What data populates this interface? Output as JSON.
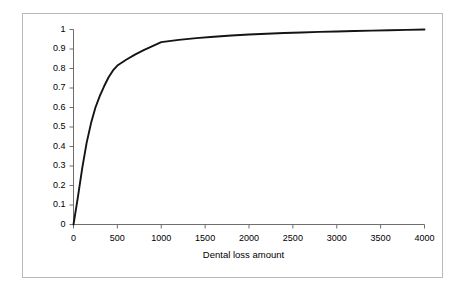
{
  "chart_data": {
    "type": "line",
    "title": "",
    "subtitle": "",
    "xlabel": "Dental loss amount",
    "ylabel": "",
    "xlim": [
      0,
      4000
    ],
    "ylim": [
      0,
      1
    ],
    "grid": false,
    "legend": null,
    "legend_position": "none",
    "x_ticks": [
      0,
      500,
      1000,
      1500,
      2000,
      2500,
      3000,
      3500,
      4000
    ],
    "x_tick_labels": [
      "0",
      "500",
      "1000",
      "1500",
      "2000",
      "2500",
      "3000",
      "3500",
      "4000"
    ],
    "y_ticks": [
      0,
      0.1,
      0.2,
      0.3,
      0.4,
      0.5,
      0.6,
      0.7,
      0.8,
      0.9,
      1
    ],
    "y_tick_labels": [
      "0",
      "0.1",
      "0.2",
      "0.3",
      "0.4",
      "0.5",
      "0.6",
      "0.7",
      "0.8",
      "0.9",
      "1"
    ],
    "series": [
      {
        "name": "Cumulative distribution of dental loss amount",
        "color": "#141414",
        "x": [
          0,
          50,
          100,
          150,
          200,
          250,
          300,
          350,
          400,
          450,
          500,
          600,
          700,
          800,
          900,
          1000,
          1200,
          1400,
          1600,
          1800,
          2000,
          2200,
          2400,
          2600,
          2800,
          3000,
          3200,
          3400,
          3600,
          3800,
          4000
        ],
        "values": [
          0,
          0.14,
          0.29,
          0.42,
          0.52,
          0.6,
          0.66,
          0.71,
          0.755,
          0.79,
          0.815,
          0.845,
          0.871,
          0.894,
          0.915,
          0.935,
          0.947,
          0.956,
          0.963,
          0.969,
          0.974,
          0.978,
          0.982,
          0.985,
          0.988,
          0.99,
          0.992,
          0.994,
          0.996,
          0.998,
          1.0
        ]
      }
    ]
  },
  "axes": {
    "axis_line_color": "#6e6e6e",
    "frame_color": "#b9b9b9",
    "background": "#ffffff"
  }
}
